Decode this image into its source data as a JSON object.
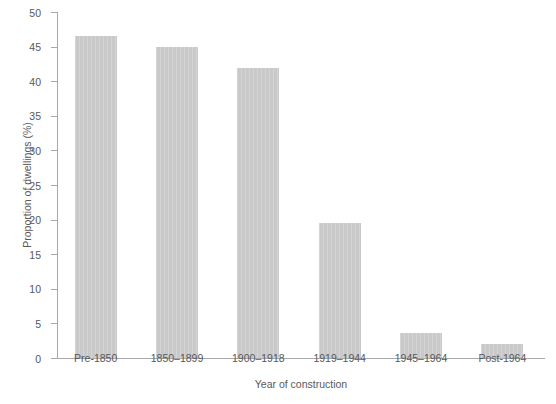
{
  "chart_data": {
    "type": "bar",
    "title": "",
    "subtitle": "",
    "xlabel": "Year of construction",
    "ylabel": "Proportion of dwellings (%)",
    "categories": [
      "Pre-1850",
      "1850–1899",
      "1900–1918",
      "1919–1944",
      "1945–1964",
      "Post-1964"
    ],
    "values": [
      46.5,
      45.0,
      41.9,
      19.5,
      3.6,
      2.0
    ],
    "ylim": [
      0,
      50
    ],
    "ytick_labels": [
      "0",
      "5",
      "10",
      "15",
      "20",
      "25",
      "30",
      "35",
      "40",
      "45",
      "50"
    ],
    "ytick_values": [
      0,
      5,
      10,
      15,
      20,
      25,
      30,
      35,
      40,
      45,
      50
    ],
    "grid": false,
    "legend": null,
    "bar_color": "#c9c9c9",
    "axis_color": "#a7a9ac",
    "text_color": "#58585a",
    "background": "#ffffff"
  }
}
